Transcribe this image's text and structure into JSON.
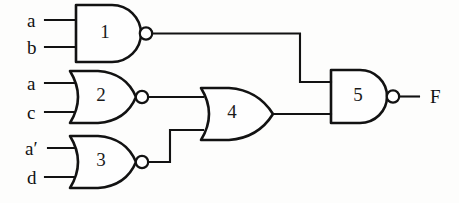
{
  "diagram": {
    "type": "logic-circuit-schematic",
    "stroke_color": "#121212",
    "background_color": "#fdfdfc"
  },
  "inputs": [
    {
      "id": "in-a-1",
      "label": "a",
      "x": 27,
      "y": 20,
      "wire_from_x": 45,
      "wire_to_x": 76,
      "gate": "1"
    },
    {
      "id": "in-b",
      "label": "b",
      "x": 27,
      "y": 47,
      "wire_from_x": 45,
      "wire_to_x": 76,
      "gate": "1"
    },
    {
      "id": "in-a-2",
      "label": "a",
      "x": 27,
      "y": 83,
      "wire_from_x": 45,
      "wire_to_x": 78,
      "gate": "2"
    },
    {
      "id": "in-c",
      "label": "c",
      "x": 27,
      "y": 112,
      "wire_from_x": 45,
      "wire_to_x": 78,
      "gate": "2"
    },
    {
      "id": "in-a-prime",
      "label": "a′",
      "x": 25,
      "y": 148,
      "wire_from_x": 48,
      "wire_to_x": 78,
      "gate": "3"
    },
    {
      "id": "in-d",
      "label": "d",
      "x": 27,
      "y": 177,
      "wire_from_x": 45,
      "wire_to_x": 78,
      "gate": "3"
    }
  ],
  "gates": [
    {
      "number": "1",
      "kind": "NAND",
      "label_x": 105,
      "label_y": 34
    },
    {
      "number": "2",
      "kind": "NOR",
      "label_x": 101,
      "label_y": 97
    },
    {
      "number": "3",
      "kind": "NOR",
      "label_x": 101,
      "label_y": 162
    },
    {
      "number": "4",
      "kind": "OR",
      "label_x": 232,
      "label_y": 114
    },
    {
      "number": "5",
      "kind": "NAND",
      "label_x": 358,
      "label_y": 97
    }
  ],
  "output": {
    "label": "F",
    "x": 430,
    "y": 96
  }
}
